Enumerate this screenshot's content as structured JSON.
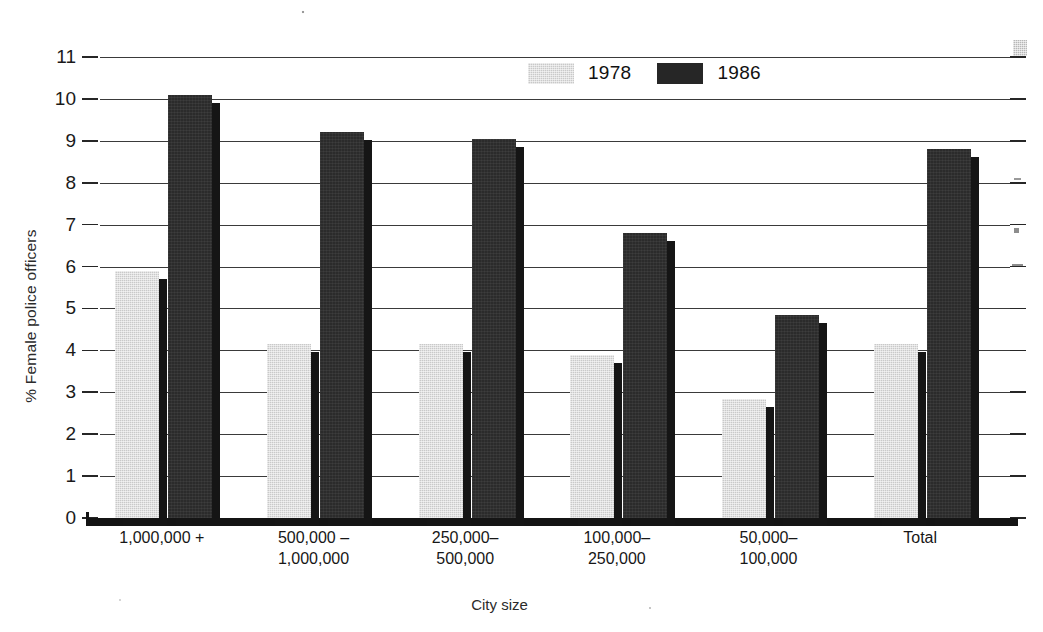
{
  "chart_data": {
    "type": "bar",
    "title": "",
    "xlabel": "City size",
    "ylabel": "% Female police officers",
    "ylim": [
      0,
      11
    ],
    "ytick_labels": [
      "0",
      "1",
      "2",
      "3",
      "4",
      "5",
      "6",
      "7",
      "8",
      "9",
      "10",
      "11"
    ],
    "grid": true,
    "legend_position": "top-center",
    "categories": [
      "1,000,000 +",
      "500,000 –\n1,000,000",
      "250,000–\n500,000",
      "100,000–\n250,000",
      "50,000–\n100,000",
      "Total"
    ],
    "series": [
      {
        "name": "1978",
        "color": "#c9c9c9",
        "values": [
          5.9,
          4.15,
          4.15,
          3.9,
          2.85,
          4.15
        ]
      },
      {
        "name": "1986",
        "color": "#2b2b2b",
        "values": [
          10.1,
          9.2,
          9.05,
          6.8,
          4.85,
          8.8
        ]
      }
    ]
  },
  "legend": {
    "items": [
      {
        "label": "1978",
        "swatch": "legend-swatch-1978"
      },
      {
        "label": "1986",
        "swatch": "legend-swatch-1986"
      }
    ]
  },
  "axes": {
    "y_title": "% Female police officers",
    "x_title": "City size"
  }
}
